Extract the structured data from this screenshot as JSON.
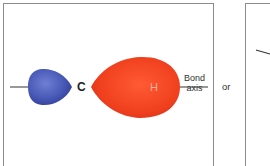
{
  "diagram": {
    "type": "sp3-hybrid-orbital-cross-section",
    "labels": {
      "carbon": "C",
      "hydrogen": "H",
      "bond_axis_line1": "Bond",
      "bond_axis_line2": "axis",
      "connector": "or"
    },
    "colors": {
      "small_lobe": "#4a5bb8",
      "large_lobe": "#f0401e",
      "border": "#8c8c8c",
      "axis_line": "#333333"
    }
  }
}
